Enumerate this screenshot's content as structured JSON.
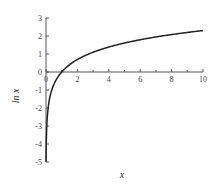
{
  "chart_data": {
    "type": "line",
    "title": "",
    "xlabel": "x",
    "ylabel": "ln x",
    "xlim": [
      0,
      10
    ],
    "ylim": [
      -5,
      3
    ],
    "x_ticks": [
      0,
      2,
      4,
      6,
      8,
      10
    ],
    "x_minor_ticks": [
      1,
      3,
      5,
      7,
      9
    ],
    "y_ticks": [
      -5,
      -4,
      -3,
      -2,
      -1,
      0,
      1,
      2,
      3
    ],
    "grid": false,
    "legend": null,
    "series": [
      {
        "name": "ln x",
        "function": "ln(x)",
        "color": "#222222",
        "x": [
          0.007,
          0.02,
          0.05,
          0.1,
          0.2,
          0.3,
          0.5,
          0.75,
          1,
          1.5,
          2,
          3,
          4,
          5,
          6,
          7,
          8,
          9,
          10
        ],
        "values": [
          -4.96,
          -3.91,
          -3.0,
          -2.3,
          -1.61,
          -1.2,
          -0.69,
          -0.29,
          0,
          0.41,
          0.69,
          1.1,
          1.39,
          1.61,
          1.79,
          1.95,
          2.08,
          2.2,
          2.3
        ]
      }
    ]
  }
}
